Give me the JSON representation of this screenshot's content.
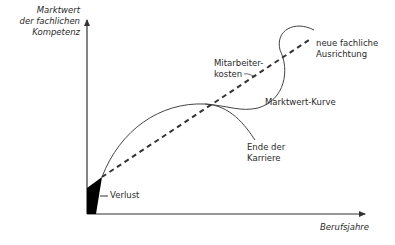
{
  "diagram": {
    "y_axis_label": [
      "Marktwert",
      "der fachlichen",
      "Kompetenz"
    ],
    "x_axis_label": "Berufsjahre",
    "labels": {
      "employee_costs": [
        "Mitarbeiter-",
        "kosten"
      ],
      "new_orientation": [
        "neue fachliche",
        "Ausrichtung"
      ],
      "market_value_curve": "Marktwert-Kurve",
      "career_end": [
        "Ende der",
        "Karriere"
      ],
      "loss": "Verlust"
    },
    "colors": {
      "line": "#333333",
      "text": "#2a2a2a",
      "loss_fill": "#000000",
      "background": "#ffffff"
    }
  }
}
